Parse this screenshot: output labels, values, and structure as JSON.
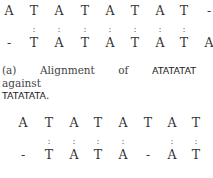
{
  "figure_a": {
    "top": [
      "A",
      "T",
      "A",
      "T",
      "A",
      "T",
      "A",
      "T",
      "-"
    ],
    "match": [
      "",
      ":",
      ":",
      ":",
      ":",
      ":",
      ":",
      ":",
      ""
    ],
    "bottom": [
      "-",
      "T",
      "A",
      "T",
      "A",
      "T",
      "A",
      "T",
      "A"
    ],
    "caption": {
      "label": "(a)",
      "text1": "Alignment",
      "text2": "of",
      "seq1": "ATATATAT",
      "text3": "against",
      "seq2": "TATATATA",
      "end": "."
    }
  },
  "figure_b": {
    "top": [
      "A",
      "T",
      "A",
      "T",
      "A",
      "T",
      "A",
      "T"
    ],
    "match": [
      "",
      ":",
      ":",
      ":",
      ":",
      "",
      ":",
      ":"
    ],
    "bottom": [
      "-",
      "T",
      "A",
      "T",
      "A",
      "-",
      "A",
      "T"
    ]
  }
}
